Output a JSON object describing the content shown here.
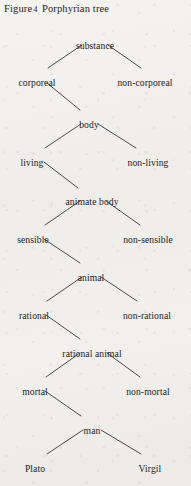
{
  "figure": {
    "caption_prefix": "Figure",
    "caption_number": "4",
    "caption_title": "Porphyrian tree",
    "ink_color": "#24221f",
    "paper_color": "#f2f1ee",
    "line_color": "#3a3733"
  },
  "tree": {
    "type": "binary-division-tree",
    "nodes": [
      {
        "id": "substance",
        "label": "substance",
        "x": 95,
        "y": 40,
        "level": 0,
        "role": "root"
      },
      {
        "id": "corporeal",
        "label": "corporeal",
        "x": 37,
        "y": 77,
        "level": 1,
        "role": "left-branch"
      },
      {
        "id": "non-corporeal",
        "label": "non-corporeal",
        "x": 145,
        "y": 77,
        "level": 1,
        "role": "right-branch"
      },
      {
        "id": "body",
        "label": "body",
        "x": 89,
        "y": 119,
        "level": 2,
        "role": "left-branch"
      },
      {
        "id": "living",
        "label": "living",
        "x": 32,
        "y": 157,
        "level": 3,
        "role": "left-branch"
      },
      {
        "id": "non-living",
        "label": "non-living",
        "x": 148,
        "y": 157,
        "level": 3,
        "role": "right-branch"
      },
      {
        "id": "animate-body",
        "label": "animate body",
        "x": 92,
        "y": 196,
        "level": 4,
        "role": "left-branch"
      },
      {
        "id": "sensible",
        "label": "sensible",
        "x": 33,
        "y": 234,
        "level": 5,
        "role": "left-branch"
      },
      {
        "id": "non-sensible",
        "label": "non-sensible",
        "x": 148,
        "y": 234,
        "level": 5,
        "role": "right-branch"
      },
      {
        "id": "animal",
        "label": "animal",
        "x": 91,
        "y": 272,
        "level": 6,
        "role": "left-branch"
      },
      {
        "id": "rational",
        "label": "rational",
        "x": 34,
        "y": 310,
        "level": 7,
        "role": "left-branch"
      },
      {
        "id": "non-rational",
        "label": "non-rational",
        "x": 147,
        "y": 310,
        "level": 7,
        "role": "right-branch"
      },
      {
        "id": "rational-animal",
        "label": "rational animal",
        "x": 92,
        "y": 348,
        "level": 8,
        "role": "left-branch"
      },
      {
        "id": "mortal",
        "label": "mortal",
        "x": 35,
        "y": 386,
        "level": 9,
        "role": "left-branch"
      },
      {
        "id": "non-mortal",
        "label": "non-mortal",
        "x": 148,
        "y": 386,
        "level": 9,
        "role": "right-branch"
      },
      {
        "id": "man",
        "label": "man",
        "x": 92,
        "y": 425,
        "level": 10,
        "role": "left-branch"
      },
      {
        "id": "plato",
        "label": "Plato",
        "x": 35,
        "y": 463,
        "level": 11,
        "role": "leaf"
      },
      {
        "id": "virgil",
        "label": "Virgil",
        "x": 150,
        "y": 463,
        "level": 11,
        "role": "leaf"
      }
    ],
    "edges": [
      {
        "from": "substance",
        "to": "corporeal",
        "x1": 82,
        "y1": 45,
        "x2": 48,
        "y2": 68
      },
      {
        "from": "substance",
        "to": "non-corporeal",
        "x1": 108,
        "y1": 45,
        "x2": 141,
        "y2": 68
      },
      {
        "from": "corporeal",
        "to": "body",
        "x1": 47,
        "y1": 83,
        "x2": 80,
        "y2": 110
      },
      {
        "from": "body",
        "to": "living",
        "x1": 81,
        "y1": 124,
        "x2": 45,
        "y2": 148
      },
      {
        "from": "body",
        "to": "non-living",
        "x1": 98,
        "y1": 124,
        "x2": 136,
        "y2": 148
      },
      {
        "from": "living",
        "to": "animate-body",
        "x1": 44,
        "y1": 162,
        "x2": 78,
        "y2": 188
      },
      {
        "from": "animate-body",
        "to": "sensible",
        "x1": 80,
        "y1": 201,
        "x2": 45,
        "y2": 225
      },
      {
        "from": "animate-body",
        "to": "non-sensible",
        "x1": 106,
        "y1": 201,
        "x2": 140,
        "y2": 225
      },
      {
        "from": "sensible",
        "to": "animal",
        "x1": 44,
        "y1": 239,
        "x2": 80,
        "y2": 263
      },
      {
        "from": "animal",
        "to": "rational",
        "x1": 82,
        "y1": 277,
        "x2": 47,
        "y2": 301
      },
      {
        "from": "animal",
        "to": "non-rational",
        "x1": 101,
        "y1": 277,
        "x2": 137,
        "y2": 301
      },
      {
        "from": "rational",
        "to": "rational-animal",
        "x1": 46,
        "y1": 315,
        "x2": 80,
        "y2": 339
      },
      {
        "from": "rational-animal",
        "to": "mortal",
        "x1": 80,
        "y1": 353,
        "x2": 46,
        "y2": 377
      },
      {
        "from": "rational-animal",
        "to": "non-mortal",
        "x1": 107,
        "y1": 353,
        "x2": 140,
        "y2": 377
      },
      {
        "from": "mortal",
        "to": "man",
        "x1": 45,
        "y1": 391,
        "x2": 81,
        "y2": 416
      },
      {
        "from": "man",
        "to": "plato",
        "x1": 83,
        "y1": 430,
        "x2": 47,
        "y2": 454
      },
      {
        "from": "man",
        "to": "virgil",
        "x1": 101,
        "y1": 430,
        "x2": 141,
        "y2": 454
      }
    ]
  }
}
